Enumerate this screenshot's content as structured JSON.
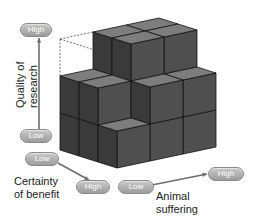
{
  "diagram": {
    "title": "",
    "type": "3d-cube-model",
    "axes": {
      "quality": {
        "title": "Quality of research",
        "title_lines": [
          "Quality of",
          "research"
        ],
        "low": "Low",
        "high": "High"
      },
      "certainty": {
        "title": "Certainty of benefit",
        "title_lines": [
          "Certainty",
          "of benefit"
        ],
        "low": "Low",
        "high": "High"
      },
      "suffering": {
        "title": "Animal suffering",
        "title_lines": [
          "Animal",
          "suffering"
        ],
        "low": "Low",
        "high": "High"
      }
    },
    "grid": "3x3x3",
    "colors": {
      "cube_top": "#7d7d7d",
      "cube_front": "#3a3a3a",
      "cube_side": "#4f4f4f",
      "pill": "#a8a8a8",
      "arrow": "#6e6e6e",
      "edge": "#111111"
    }
  }
}
